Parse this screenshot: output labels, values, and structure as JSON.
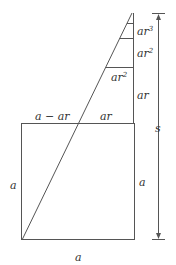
{
  "diagram": {
    "title": "",
    "colors": {
      "line": "#555555",
      "text": "#333333",
      "background": "#ffffff"
    },
    "labels": {
      "ar3": {
        "base": "ar",
        "exp": "3"
      },
      "ar2_right": {
        "base": "ar",
        "exp": "2"
      },
      "ar2_inner": {
        "base": "ar",
        "exp": "2"
      },
      "ar_right": "ar",
      "a_minus_ar": "a − ar",
      "ar_top": "ar",
      "s": "s",
      "a_left": "a",
      "a_right": "a",
      "a_bottom": "a"
    },
    "shapes": {
      "square": {
        "side_label": "a"
      },
      "triangle": {
        "description": "right triangle with nested geometric segments ar, ar^2, ar^3"
      },
      "dimension_arrow": {
        "label": "s",
        "direction": "vertical, full height"
      }
    }
  }
}
